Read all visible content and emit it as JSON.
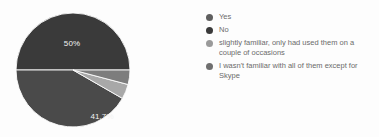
{
  "chart_data": {
    "type": "pie",
    "title": "",
    "subtitle": "",
    "xlabel": "",
    "ylabel": "",
    "grid": false,
    "legend_position": "right",
    "categories": [
      "Yes",
      "No",
      "slightly familiar, only had used them on a couple of occasions",
      "I wasn't familiar with all of them except for Skype"
    ],
    "values": [
      50,
      41.7,
      4.2,
      4.1
    ],
    "slices": [
      {
        "label": "Yes",
        "value": 50,
        "display": "50%",
        "color": "#3a3a3a",
        "show_label": true,
        "label_x": 58,
        "label_y": 39
      },
      {
        "label": "No",
        "value": 41.7,
        "display": "41.7%",
        "color": "#4a4a4a",
        "show_label": true,
        "label_x": 88,
        "label_y": 112
      },
      {
        "label": "slightly familiar, only had used them on a couple of occasions",
        "value": 4.2,
        "display": "4.2%",
        "color": "#a8a8a8",
        "show_label": false,
        "label_x": 0,
        "label_y": 0
      },
      {
        "label": "I wasn't familiar with all of them except for Skype",
        "value": 4.1,
        "display": "4.1%",
        "color": "#7d7d7d",
        "show_label": false,
        "label_x": 0,
        "label_y": 0
      }
    ]
  },
  "legend": {
    "items": [
      {
        "label": "Yes",
        "color": "#5f5f5f"
      },
      {
        "label": "No",
        "color": "#3a3a3a"
      },
      {
        "label": "slightly familiar, only had used them on a couple of occasions",
        "color": "#9a9a9a"
      },
      {
        "label": "I wasn't familiar with all of them except for Skype",
        "color": "#6f6f6f"
      }
    ]
  },
  "geometry": {
    "center_x": 59,
    "center_y": 63,
    "radius": 57
  },
  "colors": {
    "background": "#fdfdfd",
    "label_text": "#f2f2f2",
    "legend_text": "#6b6b6b",
    "separator": "#e8e8e8"
  }
}
